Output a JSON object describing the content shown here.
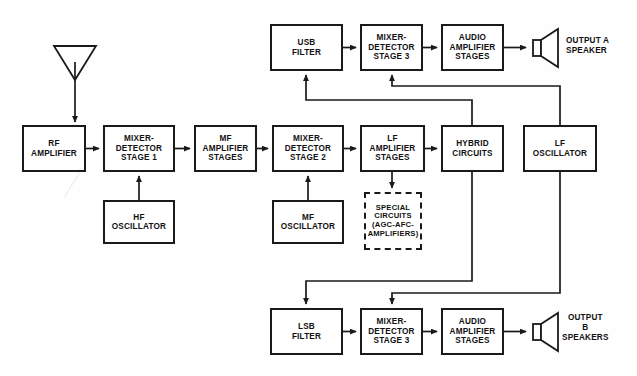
{
  "diagram": {
    "type": "block-diagram",
    "canvas": {
      "width": 637,
      "height": 376
    },
    "stroke_color": "#1a1a1a",
    "fill_color": "#ffffff",
    "text_color": "#111111"
  },
  "blocks": [
    {
      "id": "rf-amplifier",
      "label": "RF\nAMPLIFIER",
      "x": 22,
      "y": 125,
      "w": 64,
      "h": 47,
      "style": "solid"
    },
    {
      "id": "mixer-detector-1",
      "label": "MIXER-\nDETECTOR\nSTAGE 1",
      "x": 103,
      "y": 125,
      "w": 72,
      "h": 47,
      "style": "solid"
    },
    {
      "id": "mf-amplifier-stages",
      "label": "MF\nAMPLIFIER\nSTAGES",
      "x": 194,
      "y": 125,
      "w": 63,
      "h": 47,
      "style": "solid"
    },
    {
      "id": "mixer-detector-2",
      "label": "MIXER-\nDETECTOR\nSTAGE 2",
      "x": 272,
      "y": 125,
      "w": 72,
      "h": 47,
      "style": "solid"
    },
    {
      "id": "lf-amplifier-stages",
      "label": "LF\nAMPLIFIER\nSTAGES",
      "x": 360,
      "y": 125,
      "w": 65,
      "h": 47,
      "style": "solid"
    },
    {
      "id": "hybrid-circuits",
      "label": "HYBRID\nCIRCUITS",
      "x": 441,
      "y": 125,
      "w": 63,
      "h": 47,
      "style": "solid"
    },
    {
      "id": "lf-oscillator",
      "label": "LF\nOSCILLATOR",
      "x": 523,
      "y": 125,
      "w": 74,
      "h": 47,
      "style": "solid"
    },
    {
      "id": "hf-oscillator",
      "label": "HF\nOSCILLATOR",
      "x": 103,
      "y": 200,
      "w": 72,
      "h": 44,
      "style": "solid"
    },
    {
      "id": "mf-oscillator",
      "label": "MF\nOSCILLATOR",
      "x": 272,
      "y": 200,
      "w": 72,
      "h": 44,
      "style": "solid"
    },
    {
      "id": "special-circuits",
      "label": "SPECIAL\nCIRCUITS\n(AGC-AFC-\nAMPLIFIERS)",
      "x": 364,
      "y": 192,
      "w": 58,
      "h": 58,
      "style": "dashed"
    },
    {
      "id": "usb-filter",
      "label": "USB\nFILTER",
      "x": 270,
      "y": 24,
      "w": 73,
      "h": 47,
      "style": "solid"
    },
    {
      "id": "mixer-detector-3-top",
      "label": "MIXER-\nDETECTOR\nSTAGE 3",
      "x": 360,
      "y": 24,
      "w": 63,
      "h": 47,
      "style": "solid"
    },
    {
      "id": "audio-amp-stages-a",
      "label": "AUDIO\nAMPLIFIER\nSTAGES",
      "x": 441,
      "y": 24,
      "w": 63,
      "h": 47,
      "style": "solid"
    },
    {
      "id": "lsb-filter",
      "label": "LSB\nFILTER",
      "x": 270,
      "y": 308,
      "w": 73,
      "h": 47,
      "style": "solid"
    },
    {
      "id": "mixer-detector-3-bot",
      "label": "MIXER-\nDETECTOR\nSTAGE 3",
      "x": 360,
      "y": 308,
      "w": 63,
      "h": 47,
      "style": "solid"
    },
    {
      "id": "audio-amp-stages-b",
      "label": "AUDIO\nAMPLIFIER\nSTAGES",
      "x": 441,
      "y": 308,
      "w": 63,
      "h": 47,
      "style": "solid"
    }
  ],
  "labels": [
    {
      "id": "output-a-label",
      "text": "OUTPUT A\nSPEAKER",
      "x": 566,
      "y": 34
    },
    {
      "id": "output-b-label",
      "text": "OUTPUT\nB\nSPEAKERS",
      "x": 566,
      "y": 312
    }
  ],
  "icons": [
    {
      "id": "antenna",
      "name": "antenna-icon",
      "x": 54,
      "y": 45,
      "w": 42,
      "h": 70
    },
    {
      "id": "speaker-a",
      "name": "speaker-icon-a",
      "x": 527,
      "y": 30,
      "w": 30,
      "h": 34
    },
    {
      "id": "speaker-b",
      "name": "speaker-icon-b",
      "x": 527,
      "y": 314,
      "w": 30,
      "h": 34
    }
  ],
  "connections": [
    {
      "id": "antenna-to-rf",
      "from": "antenna",
      "to": "rf-amplifier",
      "arrow": true
    },
    {
      "id": "rf-to-mixer1",
      "from": "rf-amplifier",
      "to": "mixer-detector-1",
      "arrow": true
    },
    {
      "id": "hf-osc-to-mixer1",
      "from": "hf-oscillator",
      "to": "mixer-detector-1",
      "arrow": true
    },
    {
      "id": "mixer1-to-mf-amp",
      "from": "mixer-detector-1",
      "to": "mf-amplifier-stages",
      "arrow": true
    },
    {
      "id": "mf-amp-to-mixer2",
      "from": "mf-amplifier-stages",
      "to": "mixer-detector-2",
      "arrow": true
    },
    {
      "id": "mf-osc-to-mixer2",
      "from": "mf-oscillator",
      "to": "mixer-detector-2",
      "arrow": true
    },
    {
      "id": "mixer2-to-lf-amp",
      "from": "mixer-detector-2",
      "to": "lf-amplifier-stages",
      "arrow": true
    },
    {
      "id": "lf-amp-to-hybrid",
      "from": "lf-amplifier-stages",
      "to": "hybrid-circuits",
      "arrow": true
    },
    {
      "id": "lf-amp-to-special",
      "from": "lf-amplifier-stages",
      "to": "special-circuits",
      "arrow": true
    },
    {
      "id": "hybrid-to-usb-filter",
      "from": "hybrid-circuits",
      "to": "usb-filter",
      "arrow": true
    },
    {
      "id": "hybrid-to-lsb-filter",
      "from": "hybrid-circuits",
      "to": "lsb-filter",
      "arrow": true
    },
    {
      "id": "lf-osc-to-mixer3-top",
      "from": "lf-oscillator",
      "to": "mixer-detector-3-top",
      "arrow": true
    },
    {
      "id": "lf-osc-to-mixer3-bot",
      "from": "lf-oscillator",
      "to": "mixer-detector-3-bot",
      "arrow": true
    },
    {
      "id": "usb-to-mixer3-top",
      "from": "usb-filter",
      "to": "mixer-detector-3-top",
      "arrow": true
    },
    {
      "id": "mixer3-top-to-audio-a",
      "from": "mixer-detector-3-top",
      "to": "audio-amp-stages-a",
      "arrow": true
    },
    {
      "id": "audio-a-to-speaker-a",
      "from": "audio-amp-stages-a",
      "to": "speaker-a",
      "arrow": true
    },
    {
      "id": "lsb-to-mixer3-bot",
      "from": "lsb-filter",
      "to": "mixer-detector-3-bot",
      "arrow": true
    },
    {
      "id": "mixer3-bot-to-audio-b",
      "from": "mixer-detector-3-bot",
      "to": "audio-amp-stages-b",
      "arrow": true
    },
    {
      "id": "audio-b-to-speaker-b",
      "from": "audio-amp-stages-b",
      "to": "speaker-b",
      "arrow": true
    }
  ]
}
